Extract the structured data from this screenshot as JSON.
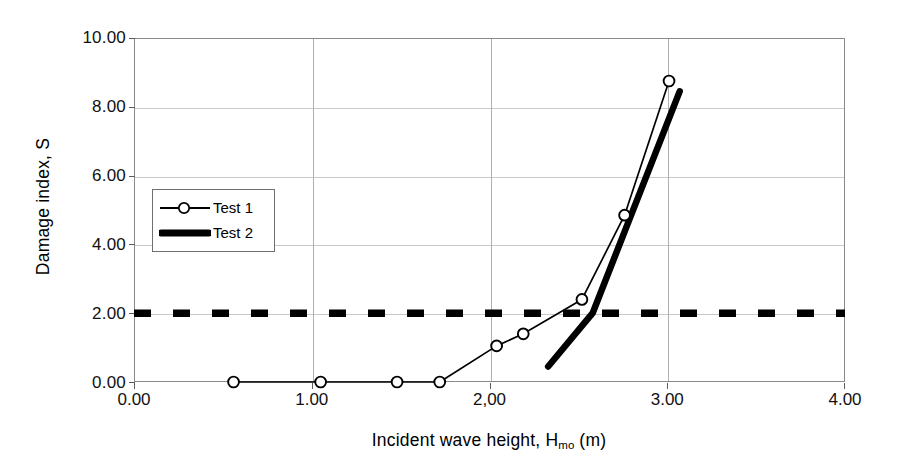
{
  "chart_data": {
    "type": "line",
    "title": "",
    "xlabel": "Incident wave height, H",
    "xlabel_sub": "mo",
    "xlabel_unit": " (m)",
    "ylabel": "Damage index, S",
    "xlim": [
      0.0,
      4.0
    ],
    "ylim": [
      0.0,
      10.0
    ],
    "xticks": [
      "0.00",
      "1.00",
      "2,00",
      "3.00",
      "4.00"
    ],
    "xtick_values": [
      0.0,
      1.0,
      2.0,
      3.0,
      4.0
    ],
    "yticks": [
      "0.00",
      "2.00",
      "4.00",
      "6.00",
      "8.00",
      "10.00"
    ],
    "ytick_values": [
      0.0,
      2.0,
      4.0,
      6.0,
      8.0,
      10.0
    ],
    "grid": true,
    "legend_position": "inside-left",
    "series": [
      {
        "name": "Test 1",
        "style": "thin-line-open-circle-markers",
        "color": "#000000",
        "points": [
          {
            "x": 0.56,
            "y": 0.0
          },
          {
            "x": 1.05,
            "y": 0.0
          },
          {
            "x": 1.48,
            "y": 0.0
          },
          {
            "x": 1.72,
            "y": 0.0
          },
          {
            "x": 2.04,
            "y": 1.05
          },
          {
            "x": 2.19,
            "y": 1.4
          },
          {
            "x": 2.52,
            "y": 2.4
          },
          {
            "x": 2.76,
            "y": 4.85
          },
          {
            "x": 3.01,
            "y": 8.75
          }
        ]
      },
      {
        "name": "Test 2",
        "style": "thick-line-no-markers",
        "color": "#000000",
        "points": [
          {
            "x": 2.33,
            "y": 0.45
          },
          {
            "x": 2.58,
            "y": 2.0
          },
          {
            "x": 3.07,
            "y": 8.45
          }
        ]
      },
      {
        "name": "Damage threshold",
        "style": "thick-dashed-horizontal",
        "color": "#000000",
        "constant_y": 2.0,
        "points": [
          {
            "x": 0.0,
            "y": 2.0
          },
          {
            "x": 4.0,
            "y": 2.0
          }
        ]
      }
    ],
    "legend": [
      {
        "label": "Test 1",
        "style": "thin-line-open-circle-markers"
      },
      {
        "label": "Test 2",
        "style": "thick-line-no-markers"
      }
    ]
  }
}
